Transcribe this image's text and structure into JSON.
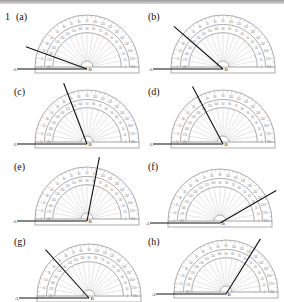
{
  "question": {
    "number": "1"
  },
  "protractor": {
    "radius": 52,
    "scale_ticks": [
      0,
      10,
      20,
      30,
      40,
      50,
      60,
      70,
      80,
      90,
      100,
      110,
      120,
      130,
      140,
      150,
      160,
      170,
      180
    ]
  },
  "panels": [
    {
      "label": "(a)",
      "label_x": 16,
      "label_y": 11,
      "cx": 87,
      "cy": 69,
      "arm_angle": 160,
      "point_a": "A",
      "point_b": "B"
    },
    {
      "label": "(b)",
      "label_x": 148,
      "label_y": 11,
      "cx": 223,
      "cy": 69,
      "arm_angle": 139,
      "point_a": "A",
      "point_b": "B"
    },
    {
      "label": "(c)",
      "label_x": 14,
      "label_y": 86,
      "cx": 87,
      "cy": 144,
      "arm_angle": 111,
      "point_a": "A",
      "point_b": "B"
    },
    {
      "label": "(d)",
      "label_x": 148,
      "label_y": 86,
      "cx": 223,
      "cy": 144,
      "arm_angle": 118,
      "point_a": "A",
      "point_b": "B"
    },
    {
      "label": "(e)",
      "label_x": 14,
      "label_y": 161,
      "cx": 87,
      "cy": 221,
      "arm_angle": 79,
      "point_a": "A",
      "point_b": "B"
    },
    {
      "label": "(f)",
      "label_x": 148,
      "label_y": 161,
      "cx": 220,
      "cy": 223,
      "arm_angle": 30,
      "point_a": "A",
      "point_b": "B"
    },
    {
      "label": "(g)",
      "label_x": 14,
      "label_y": 236,
      "cx": 89,
      "cy": 298,
      "arm_angle": 132,
      "point_a": "A",
      "point_b": "B"
    },
    {
      "label": "(h)",
      "label_x": 148,
      "label_y": 236,
      "cx": 226,
      "cy": 294,
      "arm_angle": 58,
      "point_a": "A",
      "point_b": "B"
    }
  ]
}
